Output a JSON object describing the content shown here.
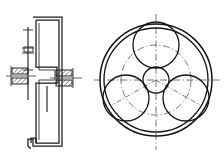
{
  "drawing": {
    "title": "Planetary Gear Assembly Drawing",
    "sheet": {
      "width": 224,
      "height": 158,
      "background_color": "#ffffff",
      "line_color": "#1a1a1a",
      "centerline_color": "#4a4a4a"
    },
    "views": [
      {
        "name": "sectional-side-view",
        "label": "Sectional Side View",
        "position": "left",
        "description": "Vertical cross-section showing housing profile, central shaft and hatched bearing blocks",
        "elements": [
          {
            "name": "housing-profile",
            "label": "Housing Profile",
            "type": "polyline",
            "points": [
              [
                35,
                19
              ],
              [
                60,
                19
              ],
              [
                60,
                144
              ],
              [
                36,
                144
              ],
              [
                36,
                137
              ],
              [
                31,
                137
              ],
              [
                31,
                144
              ],
              [
                33,
                146
              ],
              [
                62,
                146
              ],
              [
                62,
                17
              ],
              [
                33,
                17
              ],
              [
                33,
                20
              ]
            ]
          },
          {
            "name": "web-step-profile",
            "label": "Web Step Profile",
            "type": "polyline",
            "points": [
              [
                36,
                21
              ],
              [
                36,
                68
              ],
              [
                57,
                68
              ],
              [
                57,
                82
              ],
              [
                36,
                82
              ],
              [
                36,
                142
              ]
            ]
          },
          {
            "name": "shaft-centerline",
            "label": "Shaft Centerline",
            "type": "vertical-line",
            "x": 28,
            "y1": 27,
            "y2": 100
          },
          {
            "name": "shaft-body",
            "label": "Shaft Body",
            "type": "vertical-line",
            "x": 28,
            "y1": 40,
            "y2": 95
          }
        ],
        "bearings": [
          {
            "name": "bearing-left-upper",
            "label": "Left Upper Bearing",
            "x": 12,
            "y": 68,
            "width": 16,
            "height": 6,
            "hatch": "diagonal"
          },
          {
            "name": "bearing-left-lower",
            "label": "Left Lower Bearing",
            "x": 12,
            "y": 78,
            "width": 16,
            "height": 6,
            "hatch": "diagonal"
          },
          {
            "name": "bearing-right-upper",
            "label": "Right Upper Bearing",
            "x": 56,
            "y": 70,
            "width": 16,
            "height": 6,
            "hatch": "diagonal"
          },
          {
            "name": "bearing-right-lower",
            "label": "Right Lower Bearing",
            "x": 56,
            "y": 80,
            "width": 16,
            "height": 6,
            "hatch": "diagonal"
          }
        ],
        "tick_marks": [
          {
            "name": "tick-shaft-top",
            "y": 30,
            "half_width": 5
          },
          {
            "name": "tick-shaft-upper",
            "y": 48,
            "half_width": 6
          },
          {
            "name": "tick-shaft-mid",
            "y": 53,
            "half_width": 6
          },
          {
            "name": "tick-shaft-lower",
            "y": 70,
            "half_width": 5
          }
        ],
        "axis_runs": [
          {
            "name": "axis-left-bearing",
            "x1": 6,
            "x2": 36,
            "y": 76
          },
          {
            "name": "axis-right-bearing",
            "x1": 50,
            "x2": 82,
            "y": 78
          }
        ]
      },
      {
        "name": "front-view",
        "label": "Front View",
        "position": "right",
        "description": "Planetary gear train front view: ring gear, sun gear and three planet gears",
        "center": {
          "x": 156,
          "y": 80
        },
        "circles": [
          {
            "name": "ring-gear-outer",
            "label": "Ring Gear Outer Circle",
            "cx": 156,
            "cy": 80,
            "r": 56
          },
          {
            "name": "ring-gear-inner",
            "label": "Ring Gear Inner Circle",
            "cx": 156,
            "cy": 80,
            "r": 52
          },
          {
            "name": "sun-gear",
            "label": "Sun Gear",
            "cx": 156,
            "cy": 80,
            "r": 13
          },
          {
            "name": "planet-gear-top",
            "label": "Planet Gear Top",
            "cx": 156,
            "cy": 45,
            "r": 23,
            "angle_deg": 90
          },
          {
            "name": "planet-gear-lower-left",
            "label": "Planet Gear Lower Left",
            "cx": 126,
            "cy": 98,
            "r": 23,
            "angle_deg": 210
          },
          {
            "name": "planet-gear-lower-right",
            "label": "Planet Gear Lower Right",
            "cx": 186,
            "cy": 98,
            "r": 23,
            "angle_deg": 330
          }
        ],
        "pitch_circle": {
          "name": "planet-pitch-circle",
          "label": "Planet Carrier Pitch Circle",
          "cx": 156,
          "cy": 80,
          "r": 35,
          "style": "dash-dot"
        },
        "centerlines": [
          {
            "name": "centerline-horizontal",
            "label": "Horizontal Centerline",
            "x1": 94,
            "y1": 80,
            "x2": 220,
            "y2": 80
          },
          {
            "name": "centerline-vertical",
            "label": "Vertical Centerline",
            "x1": 156,
            "y1": 14,
            "x2": 156,
            "y2": 150
          },
          {
            "name": "centerline-planet-lower-left",
            "label": "Planet Axis Lower Left",
            "x1": 156,
            "y1": 80,
            "x2": 112,
            "y2": 105
          },
          {
            "name": "centerline-planet-lower-right",
            "label": "Planet Axis Lower Right",
            "x1": 156,
            "y1": 80,
            "x2": 200,
            "y2": 105
          }
        ],
        "planet_count": 3,
        "planet_spacing_deg": 120
      }
    ]
  }
}
